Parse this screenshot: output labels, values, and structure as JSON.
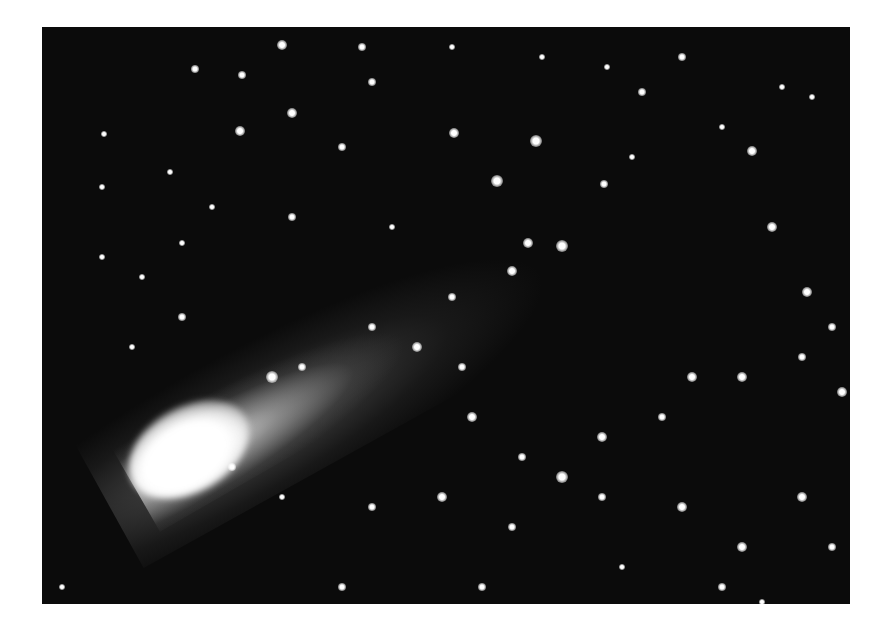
{
  "image": {
    "subject": "comet with tail against star field",
    "colors": {
      "sky": "#0b0b0b",
      "margin": "#ffffff",
      "coma": "#ffffff"
    }
  },
  "stars": [
    [
      200,
      48,
      4
    ],
    [
      153,
      42,
      4
    ],
    [
      240,
      18,
      5
    ],
    [
      198,
      104,
      5
    ],
    [
      62,
      107,
      3
    ],
    [
      128,
      145,
      3
    ],
    [
      140,
      216,
      3
    ],
    [
      250,
      86,
      5
    ],
    [
      300,
      120,
      4
    ],
    [
      330,
      55,
      4
    ],
    [
      412,
      106,
      5
    ],
    [
      455,
      154,
      6
    ],
    [
      494,
      114,
      6
    ],
    [
      520,
      219,
      6
    ],
    [
      486,
      216,
      5
    ],
    [
      470,
      244,
      5
    ],
    [
      562,
      157,
      4
    ],
    [
      590,
      130,
      3
    ],
    [
      565,
      40,
      3
    ],
    [
      600,
      65,
      4
    ],
    [
      710,
      124,
      5
    ],
    [
      740,
      60,
      3
    ],
    [
      770,
      70,
      3
    ],
    [
      730,
      200,
      5
    ],
    [
      765,
      265,
      5
    ],
    [
      790,
      300,
      4
    ],
    [
      760,
      330,
      4
    ],
    [
      700,
      350,
      5
    ],
    [
      650,
      350,
      5
    ],
    [
      620,
      390,
      4
    ],
    [
      560,
      410,
      5
    ],
    [
      520,
      450,
      6
    ],
    [
      480,
      430,
      4
    ],
    [
      430,
      390,
      5
    ],
    [
      420,
      340,
      4
    ],
    [
      375,
      320,
      5
    ],
    [
      330,
      300,
      4
    ],
    [
      230,
      350,
      6
    ],
    [
      260,
      340,
      4
    ],
    [
      140,
      290,
      4
    ],
    [
      100,
      250,
      3
    ],
    [
      190,
      440,
      4
    ],
    [
      240,
      470,
      3
    ],
    [
      330,
      480,
      4
    ],
    [
      400,
      470,
      5
    ],
    [
      470,
      500,
      4
    ],
    [
      560,
      470,
      4
    ],
    [
      640,
      480,
      5
    ],
    [
      700,
      520,
      5
    ],
    [
      760,
      470,
      5
    ],
    [
      790,
      520,
      4
    ],
    [
      800,
      365,
      5
    ],
    [
      90,
      320,
      3
    ],
    [
      60,
      230,
      3
    ],
    [
      20,
      560,
      3
    ],
    [
      300,
      560,
      4
    ],
    [
      440,
      560,
      4
    ],
    [
      580,
      540,
      3
    ],
    [
      680,
      560,
      4
    ],
    [
      720,
      575,
      3
    ],
    [
      320,
      20,
      4
    ],
    [
      410,
      20,
      3
    ],
    [
      500,
      30,
      3
    ],
    [
      640,
      30,
      4
    ],
    [
      680,
      100,
      3
    ],
    [
      60,
      160,
      3
    ],
    [
      170,
      180,
      3
    ],
    [
      250,
      190,
      4
    ],
    [
      350,
      200,
      3
    ],
    [
      410,
      270,
      4
    ]
  ]
}
